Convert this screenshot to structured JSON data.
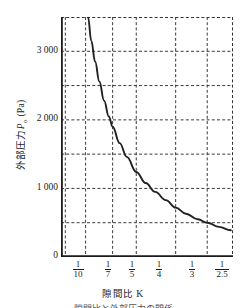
{
  "chart_data": {
    "type": "line",
    "title": "",
    "xlabel": "隙間比 K",
    "ylabel": "外部圧力 P",
    "ylabel_sub": "o",
    "ylabel_unit": "(Pa)",
    "ylabel_full": "外部圧力 Po (Pa)",
    "ylim": [
      0,
      3500
    ],
    "yticks": [
      0,
      1000,
      2000,
      3000
    ],
    "ytick_labels": [
      "0",
      "1 000",
      "2 000",
      "3 000"
    ],
    "y_gridlines": [
      500,
      1000,
      1500,
      2000,
      2500,
      3000,
      3500
    ],
    "grid": true,
    "grid_style": "dashed",
    "legend": "none",
    "xtick_labels": [
      "1/10",
      "1/7",
      "1/5",
      "1/4",
      "1/3",
      "1/2.5"
    ],
    "xtick_numerators": [
      "1",
      "1",
      "1",
      "1",
      "1",
      "1"
    ],
    "xtick_denominators": [
      "10",
      "7",
      "5",
      "4",
      "3",
      "2.5"
    ],
    "xtick_values": [
      0.1,
      0.1429,
      0.2,
      0.25,
      0.3333,
      0.4
    ],
    "x_gridline_ticks": [
      "1/10",
      "1/7",
      "1/5",
      "1/4",
      "1/3",
      "1/2.5"
    ],
    "series": [
      {
        "name": "外部圧力",
        "x": [
          0.148,
          0.155,
          0.163,
          0.172,
          0.182,
          0.192,
          0.2,
          0.215,
          0.23,
          0.25,
          0.27,
          0.29,
          0.3125,
          0.3333,
          0.355,
          0.38,
          0.4,
          0.425,
          0.45
        ],
        "values": [
          3500,
          3150,
          2850,
          2560,
          2280,
          2050,
          1900,
          1660,
          1460,
          1240,
          1080,
          950,
          830,
          720,
          630,
          550,
          500,
          440,
          390
        ]
      }
    ],
    "annotations": {
      "curve_shape": "hyperbolic decay",
      "crossing_1000Pa_at": "1/4",
      "crossing_500Pa_at": "1/2.5",
      "right_edge_value": 390
    }
  },
  "axis": {
    "y_title_main": "外部圧力",
    "y_title_symbol": "P",
    "y_title_subscript": "o",
    "y_title_unit": "(Pa)",
    "x_title": "隙間比 K",
    "origin_label": "0"
  },
  "caption": {
    "text": "隙間比と外部圧力の関係"
  }
}
